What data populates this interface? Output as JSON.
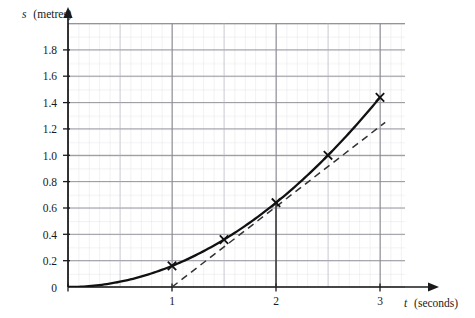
{
  "figure": {
    "background_color": "#ffffff",
    "grid": {
      "major_color": "#8a8a93",
      "minor_color": "#c9c9d2",
      "minor_per_major": 10,
      "visible": true
    },
    "axis_color": "#1a1a1a",
    "curve_color": "#111111",
    "tangent_color": "#333333"
  },
  "labels": {
    "y_axis_var": "s",
    "y_axis_unit": "(metres)",
    "x_axis_var": "t",
    "x_axis_unit": "(seconds)"
  },
  "chart_data": {
    "type": "line",
    "title": "",
    "subtitle": "",
    "xlabel": "t (seconds)",
    "ylabel": "s (metres)",
    "xlim": [
      0,
      3.25
    ],
    "ylim": [
      0,
      1.95
    ],
    "xticks": [
      0,
      1,
      2,
      3
    ],
    "xtick_labels": [
      "0",
      "1",
      "2",
      "3"
    ],
    "yticks": [
      0,
      0.2,
      0.4,
      0.6,
      0.8,
      1.0,
      1.2,
      1.4,
      1.6,
      1.8
    ],
    "ytick_labels": [
      "0",
      "0.2",
      "0.4",
      "0.6",
      "0.8",
      "1.0",
      "1.2",
      "1.4",
      "1.6",
      "1.8"
    ],
    "grid": true,
    "legend": "none",
    "series": [
      {
        "name": "displacement curve",
        "style": "solid",
        "relation": "s = 0.16 t^2",
        "x": [
          0,
          0.25,
          0.5,
          0.75,
          1.0,
          1.25,
          1.5,
          1.75,
          2.0,
          2.25,
          2.5,
          2.75,
          3.0
        ],
        "y": [
          0,
          0.01,
          0.04,
          0.09,
          0.16,
          0.25,
          0.36,
          0.49,
          0.64,
          0.81,
          1.0,
          1.21,
          1.44
        ]
      },
      {
        "name": "tangent at t = 2",
        "style": "dashed",
        "x": [
          1.0,
          3.05
        ],
        "y": [
          0.0,
          1.25
        ]
      }
    ],
    "markers": [
      {
        "label": "cross",
        "x": 1.0,
        "y": 0.16
      },
      {
        "label": "cross",
        "x": 1.5,
        "y": 0.36
      },
      {
        "label": "cross",
        "x": 2.0,
        "y": 0.64
      },
      {
        "label": "cross",
        "x": 2.5,
        "y": 1.0
      },
      {
        "label": "cross",
        "x": 3.0,
        "y": 1.44
      }
    ],
    "annotations": [
      {
        "type": "vertical-drop-line",
        "x": 2.0,
        "y_from": 0.0,
        "y_to": 0.64
      }
    ]
  }
}
